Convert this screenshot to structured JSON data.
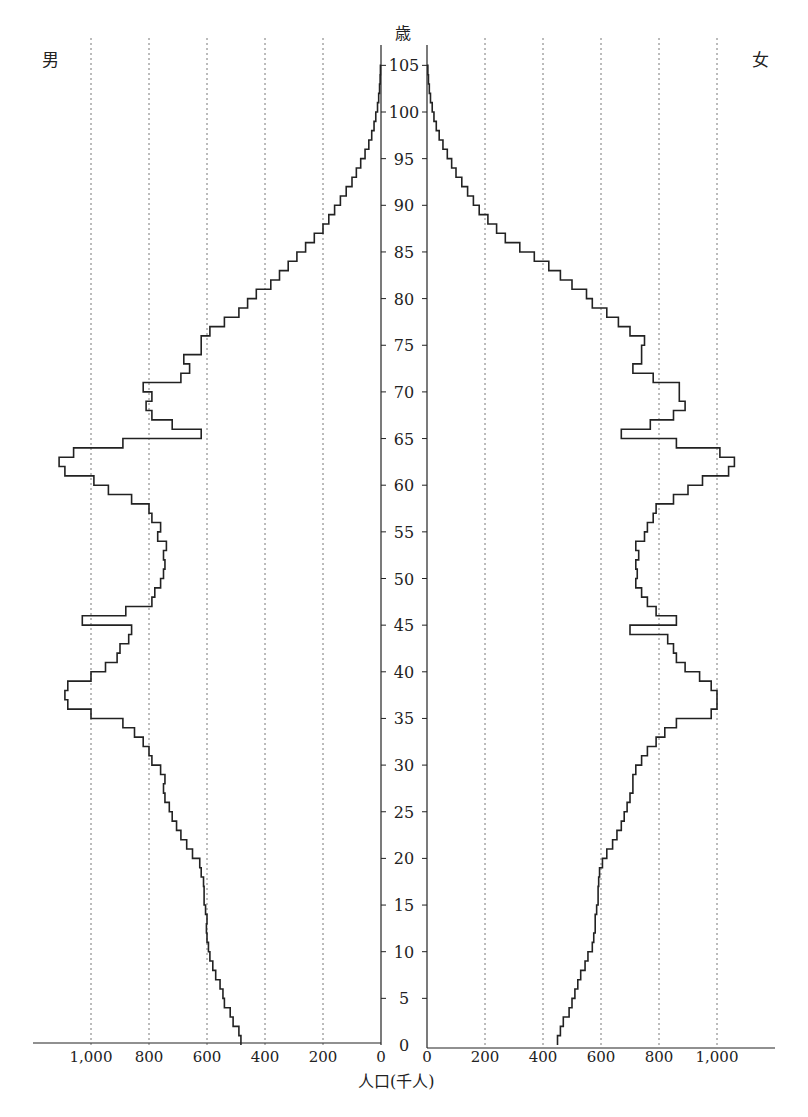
{
  "chart_data": {
    "type": "bar",
    "subtype": "population-pyramid",
    "title": "",
    "ylabel": "歳",
    "xlabel": "人口(千人)",
    "left_label": "男",
    "right_label": "女",
    "y_ticks": [
      0,
      5,
      10,
      15,
      20,
      25,
      30,
      35,
      40,
      45,
      50,
      55,
      60,
      65,
      70,
      75,
      80,
      85,
      90,
      95,
      100,
      105
    ],
    "x_ticks_left": [
      "1,000",
      "800",
      "600",
      "400",
      "200",
      "0"
    ],
    "x_ticks_right": [
      "0",
      "200",
      "400",
      "600",
      "800",
      "1,000"
    ],
    "center_zero": "0",
    "xlim": [
      0,
      1150
    ],
    "ylim": [
      0,
      105
    ],
    "grid": "vertical dotted every 200",
    "ages": [
      0,
      1,
      2,
      3,
      4,
      5,
      6,
      7,
      8,
      9,
      10,
      11,
      12,
      13,
      14,
      15,
      16,
      17,
      18,
      19,
      20,
      21,
      22,
      23,
      24,
      25,
      26,
      27,
      28,
      29,
      30,
      31,
      32,
      33,
      34,
      35,
      36,
      37,
      38,
      39,
      40,
      41,
      42,
      43,
      44,
      45,
      46,
      47,
      48,
      49,
      50,
      51,
      52,
      53,
      54,
      55,
      56,
      57,
      58,
      59,
      60,
      61,
      62,
      63,
      64,
      65,
      66,
      67,
      68,
      69,
      70,
      71,
      72,
      73,
      74,
      75,
      76,
      77,
      78,
      79,
      80,
      81,
      82,
      83,
      84,
      85,
      86,
      87,
      88,
      89,
      90,
      91,
      92,
      93,
      94,
      95,
      96,
      97,
      98,
      99,
      100,
      101,
      102,
      103,
      104
    ],
    "series": [
      {
        "name": "男",
        "values": [
          483,
          490,
          510,
          520,
          540,
          545,
          555,
          570,
          580,
          590,
          595,
          600,
          602,
          600,
          605,
          610,
          610,
          612,
          620,
          625,
          650,
          670,
          690,
          705,
          720,
          730,
          745,
          750,
          745,
          760,
          790,
          800,
          820,
          850,
          890,
          1000,
          1080,
          1090,
          1080,
          1000,
          950,
          910,
          900,
          870,
          860,
          1030,
          880,
          790,
          780,
          760,
          750,
          745,
          750,
          740,
          770,
          760,
          790,
          800,
          860,
          940,
          990,
          1090,
          1110,
          1060,
          890,
          620,
          720,
          790,
          810,
          790,
          820,
          690,
          660,
          680,
          620,
          620,
          590,
          540,
          490,
          460,
          430,
          380,
          350,
          320,
          290,
          260,
          230,
          200,
          180,
          160,
          140,
          120,
          100,
          85,
          70,
          55,
          42,
          32,
          24,
          18,
          12,
          8,
          5,
          3,
          2
        ]
      },
      {
        "name": "女",
        "values": [
          450,
          460,
          470,
          490,
          500,
          510,
          520,
          530,
          545,
          555,
          570,
          575,
          580,
          580,
          585,
          590,
          590,
          592,
          595,
          605,
          620,
          640,
          655,
          670,
          680,
          690,
          700,
          710,
          710,
          720,
          740,
          760,
          790,
          820,
          860,
          980,
          1000,
          1000,
          980,
          940,
          890,
          860,
          850,
          830,
          700,
          860,
          790,
          760,
          740,
          720,
          725,
          720,
          730,
          720,
          750,
          760,
          780,
          790,
          850,
          900,
          950,
          1040,
          1060,
          1010,
          860,
          670,
          770,
          850,
          890,
          870,
          870,
          780,
          710,
          740,
          740,
          750,
          700,
          660,
          620,
          570,
          550,
          500,
          460,
          420,
          370,
          320,
          270,
          240,
          210,
          180,
          160,
          140,
          120,
          100,
          85,
          70,
          55,
          42,
          32,
          24,
          18,
          12,
          8,
          5,
          3
        ]
      }
    ]
  }
}
